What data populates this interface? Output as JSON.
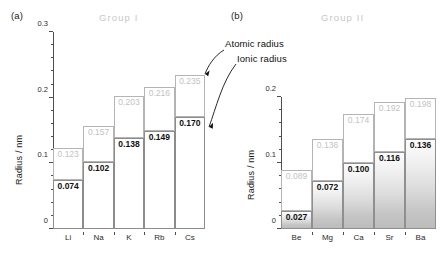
{
  "chart_data": [
    {
      "type": "bar",
      "panel": "(a)",
      "title": "Group  I",
      "ylabel": "Radius / nm",
      "xlabel": "",
      "ylim": [
        0,
        0.3
      ],
      "yticks": [
        0,
        0.1,
        0.2,
        0.3
      ],
      "ytick_labels": [
        "0",
        "0.1",
        "0.2",
        "0.3"
      ],
      "minor_tick_step": 0.02,
      "grid": false,
      "categories": [
        "Li",
        "Na",
        "K",
        "Rb",
        "Cs"
      ],
      "series": [
        {
          "name": "Atomic radius",
          "values": [
            0.123,
            0.157,
            0.203,
            0.216,
            0.235
          ],
          "labels": [
            "0.123",
            "0.157",
            "0.203",
            "0.216",
            "0.235"
          ],
          "label_color": "#c2c2c2"
        },
        {
          "name": "Ionic radius",
          "values": [
            0.074,
            0.102,
            0.138,
            0.149,
            0.17
          ],
          "labels": [
            "0.074",
            "0.102",
            "0.138",
            "0.149",
            "0.170"
          ],
          "label_color": "#111111"
        }
      ]
    },
    {
      "type": "bar",
      "panel": "(b)",
      "title": "Group  II",
      "ylabel": "Radius / nm",
      "xlabel": "",
      "ylim": [
        0,
        0.2
      ],
      "yticks": [
        0,
        0.1,
        0.2
      ],
      "ytick_labels": [
        "0",
        "0.1",
        "0.2"
      ],
      "minor_tick_step": 0.02,
      "grid": false,
      "categories": [
        "Be",
        "Mg",
        "Ca",
        "Sr",
        "Ba"
      ],
      "series": [
        {
          "name": "Atomic radius",
          "values": [
            0.089,
            0.136,
            0.174,
            0.192,
            0.198
          ],
          "labels": [
            "0.089",
            "0.136",
            "0.174",
            "0.192",
            "0.198"
          ],
          "label_color": "#c2c2c2"
        },
        {
          "name": "Ionic radius",
          "values": [
            0.027,
            0.072,
            0.1,
            0.116,
            0.136
          ],
          "labels": [
            "0.027",
            "0.072",
            "0.100",
            "0.116",
            "0.136"
          ],
          "label_color": "#111111"
        }
      ]
    }
  ],
  "annotations": {
    "atomic": "Atomic radius",
    "ionic": "Ionic radius"
  },
  "colors": {
    "axis": "#4d4d4d",
    "atomic_border": "#b4b4b4",
    "ionic_border": "#8c8c8c",
    "atomic_label": "#c2c2c2",
    "ionic_label": "#111111",
    "title": "#c9c9c9"
  }
}
